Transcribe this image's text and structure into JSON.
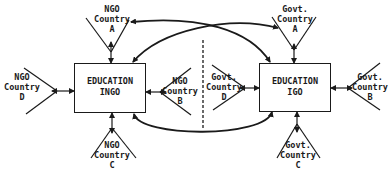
{
  "diagram": {
    "ingo_box": {
      "line1": "EDUCATION",
      "line2": "INGO"
    },
    "igo_box": {
      "line1": "EDUCATION",
      "line2": "IGO"
    },
    "ngo_a": {
      "line1": "NGO",
      "line2": "Country",
      "line3": "A"
    },
    "ngo_b": {
      "line1": "NGO",
      "line2": "Country",
      "line3": "B"
    },
    "ngo_c": {
      "line1": "NGO",
      "line2": "Country",
      "line3": "C"
    },
    "ngo_d": {
      "line1": "NGO",
      "line2": "Country",
      "line3": "D"
    },
    "govt_a": {
      "line1": "Govt.",
      "line2": "Country",
      "line3": "A"
    },
    "govt_b": {
      "line1": "Govt.",
      "line2": "Country",
      "line3": "B"
    },
    "govt_c": {
      "line1": "Govt.",
      "line2": "Country",
      "line3": "C"
    },
    "govt_d": {
      "line1": "Govt.",
      "line2": "Country",
      "line3": "D"
    },
    "colors": {
      "ink": "#1a1a1a",
      "background": "#ffffff"
    }
  }
}
